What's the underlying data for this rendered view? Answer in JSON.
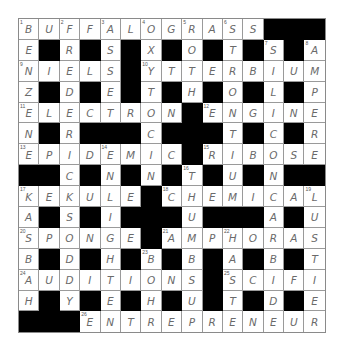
{
  "puzzle": {
    "rows": 15,
    "cols": 15,
    "grid": [
      "BUFFALOGRASS###",
      "E#R#S#X#O#T#S#A",
      "NIELS#YTTERBIUM",
      "Z#D#E#T#H#O#L#P",
      "ELECTRON#ENGINE",
      "N#R###C###T#C#R",
      "EPIDEMIC#RIBOSE",
      "##C#N#N#T#U#N##",
      "KEKULE#CHEMICAL",
      "A#S#I###U###A#U",
      "SPONGE#AMPHORAS",
      "B#D#H#B#B#A#B#T",
      "AUDITIONS#SCIFI",
      "H#Y#E#H#U#T#D#E",
      "###ENTREPRENEUR"
    ],
    "numbers": [
      {
        "r": 0,
        "c": 0,
        "n": "1"
      },
      {
        "r": 0,
        "c": 2,
        "n": "2"
      },
      {
        "r": 0,
        "c": 4,
        "n": "3"
      },
      {
        "r": 0,
        "c": 6,
        "n": "4"
      },
      {
        "r": 0,
        "c": 8,
        "n": "5"
      },
      {
        "r": 0,
        "c": 10,
        "n": "6"
      },
      {
        "r": 1,
        "c": 12,
        "n": "7"
      },
      {
        "r": 1,
        "c": 14,
        "n": "8"
      },
      {
        "r": 2,
        "c": 0,
        "n": "9"
      },
      {
        "r": 2,
        "c": 6,
        "n": "10"
      },
      {
        "r": 4,
        "c": 0,
        "n": "11"
      },
      {
        "r": 4,
        "c": 9,
        "n": "12"
      },
      {
        "r": 6,
        "c": 0,
        "n": "13"
      },
      {
        "r": 6,
        "c": 4,
        "n": "14"
      },
      {
        "r": 6,
        "c": 9,
        "n": "15"
      },
      {
        "r": 7,
        "c": 8,
        "n": "16"
      },
      {
        "r": 8,
        "c": 0,
        "n": "17"
      },
      {
        "r": 8,
        "c": 7,
        "n": "18"
      },
      {
        "r": 8,
        "c": 14,
        "n": "19"
      },
      {
        "r": 10,
        "c": 0,
        "n": "20"
      },
      {
        "r": 10,
        "c": 7,
        "n": "21"
      },
      {
        "r": 10,
        "c": 10,
        "n": "22"
      },
      {
        "r": 11,
        "c": 6,
        "n": "23"
      },
      {
        "r": 12,
        "c": 0,
        "n": "24"
      },
      {
        "r": 12,
        "c": 10,
        "n": "25"
      },
      {
        "r": 14,
        "c": 3,
        "n": "26"
      }
    ],
    "answers": {
      "across": [
        {
          "n": "1",
          "answer": "BUFFALOGRASS"
        },
        {
          "n": "9",
          "answer": "NIELS"
        },
        {
          "n": "10",
          "answer": "YTTERBIUM"
        },
        {
          "n": "11",
          "answer": "ELECTRON"
        },
        {
          "n": "12",
          "answer": "ENGINE"
        },
        {
          "n": "13",
          "answer": "EPIDEMIC"
        },
        {
          "n": "15",
          "answer": "RIBOSE"
        },
        {
          "n": "17",
          "answer": "KEKULE"
        },
        {
          "n": "18",
          "answer": "CHEMICAL"
        },
        {
          "n": "20",
          "answer": "SPONGE"
        },
        {
          "n": "21",
          "answer": "AMPHORAS"
        },
        {
          "n": "24",
          "answer": "AUDITIONS"
        },
        {
          "n": "25",
          "answer": "SCIFI"
        },
        {
          "n": "26",
          "answer": "ENTREPRENEUR"
        }
      ],
      "down": [
        {
          "n": "1",
          "answer": "BENZENE"
        },
        {
          "n": "2",
          "answer": "FRIEDRICH"
        },
        {
          "n": "3",
          "answer": "ASSESSED"
        },
        {
          "n": "4",
          "answer": "OXYTOCIN"
        },
        {
          "n": "5",
          "answer": "ROTH"
        },
        {
          "n": "6",
          "answer": "STROTIUM"
        },
        {
          "n": "7",
          "answer": "SILICON"
        },
        {
          "n": "8",
          "answer": "AMPERE"
        },
        {
          "n": "14",
          "answer": "ENLIGHTEN"
        },
        {
          "n": "16",
          "answer": "THUMBSUP"
        },
        {
          "n": "17",
          "answer": "KASBAH"
        },
        {
          "n": "19",
          "answer": "LUSTIER"
        },
        {
          "n": "22",
          "answer": "HASTE"
        },
        {
          "n": "23",
          "answer": "BOH"
        }
      ]
    }
  },
  "colors": {
    "block": "#000000",
    "cell": "#ffffff",
    "gridline": "#9a9a9a",
    "letter": "#6a6a6a",
    "number": "#555555"
  }
}
